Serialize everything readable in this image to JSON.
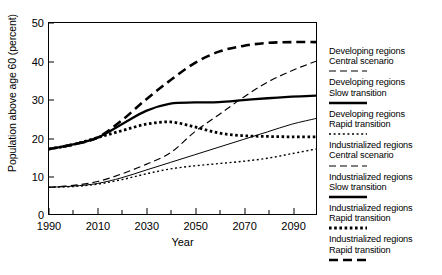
{
  "chart_data": {
    "type": "line",
    "title": "",
    "xlabel": "Year",
    "ylabel": "Population above age 60 (percent)",
    "xlim": [
      1990,
      2100
    ],
    "ylim": [
      0,
      50
    ],
    "y_axis_zero_label": "0",
    "yticks": [
      10,
      20,
      30,
      40,
      50
    ],
    "xticks": [
      1990,
      2010,
      2030,
      2050,
      2070,
      2090
    ],
    "xticks_minor": [
      2000,
      2020,
      2040,
      2060,
      2080,
      2100
    ],
    "grid": false,
    "legend_position": "right",
    "x": [
      1990,
      2000,
      2010,
      2020,
      2030,
      2040,
      2050,
      2060,
      2070,
      2080,
      2090,
      2100
    ],
    "series": [
      {
        "name": "Developing regions Central scenario",
        "region": "Developing regions",
        "scenario": "Central scenario",
        "style": "thin-dashed",
        "color": "#000000",
        "values": [
          7,
          7.5,
          8.5,
          10.5,
          13,
          16,
          21.5,
          26,
          30.5,
          34.5,
          37.5,
          40
        ]
      },
      {
        "name": "Developing regions Slow transition",
        "region": "Developing regions",
        "scenario": "Slow transition",
        "style": "thin-solid",
        "color": "#000000",
        "values": [
          7,
          7.3,
          8,
          9.5,
          11.5,
          13.5,
          15.5,
          17.5,
          19.5,
          21.5,
          23.5,
          25
        ]
      },
      {
        "name": "Developing regions Rapid transition",
        "region": "Developing regions",
        "scenario": "Rapid transition",
        "style": "thin-dotted",
        "color": "#000000",
        "values": [
          7,
          7.2,
          7.8,
          9,
          10.5,
          11.8,
          12.6,
          13.2,
          13.8,
          14.6,
          15.8,
          17
        ]
      },
      {
        "name": "Industrialized regions Central scenario",
        "region": "Industrialized regions",
        "scenario": "Central scenario",
        "style": "thick-dashed",
        "color": "#000000",
        "values": [
          17,
          18.2,
          20,
          24.5,
          30,
          35,
          39.5,
          42.5,
          44,
          44.8,
          45,
          45
        ]
      },
      {
        "name": "Industrialized regions Slow transition",
        "region": "Industrialized regions",
        "scenario": "Slow transition",
        "style": "thick-solid",
        "color": "#000000",
        "values": [
          17,
          18.2,
          20,
          23.5,
          27,
          28.9,
          29.2,
          29.3,
          29.8,
          30.3,
          30.7,
          31
        ]
      },
      {
        "name": "Industrialized regions Rapid transition",
        "region": "Industrialized regions",
        "scenario": "Rapid transition",
        "style": "thick-dotted",
        "color": "#000000",
        "values": [
          17,
          18.2,
          20,
          21.8,
          23.5,
          24.1,
          22.8,
          21.2,
          20.5,
          20.3,
          20.2,
          20.2
        ]
      }
    ]
  },
  "legend": {
    "entries": [
      {
        "line1": "Developing regions",
        "line2": "Central scenario",
        "style": "thin-dashed"
      },
      {
        "line1": "Developing regions",
        "line2": "Slow transition",
        "style": "thick-solid"
      },
      {
        "line1": "Developing regions",
        "line2": "Rapid transition",
        "style": "thin-dotted"
      },
      {
        "line1": "Industrialized regions",
        "line2": "Central scenario",
        "style": "thin-dashed-wide"
      },
      {
        "line1": "Industrialized regions",
        "line2": "Slow transition",
        "style": "thick-solid"
      },
      {
        "line1": "Industrialized regions",
        "line2": "Rapid transition",
        "style": "thick-dotted"
      },
      {
        "line1": "Industrialized regions",
        "line2": "Rapid transition",
        "style": "thick-dashed"
      }
    ]
  }
}
